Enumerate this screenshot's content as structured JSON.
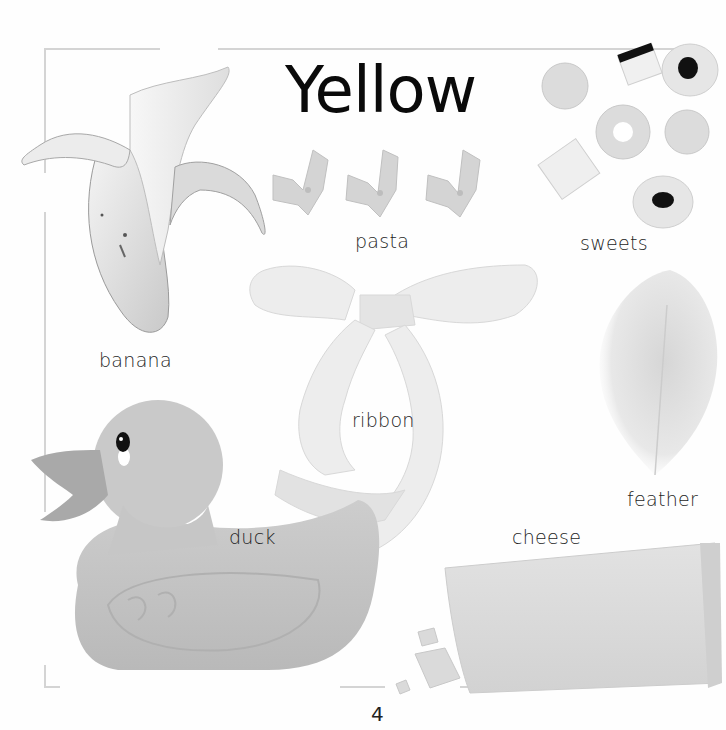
{
  "page": {
    "title": "Yellow",
    "page_number": "4",
    "colors": {
      "background": "#ffffff",
      "frame": "#d4d4d4",
      "text": "#1a1a1a"
    }
  },
  "items": [
    {
      "id": "banana",
      "label": "banana",
      "icon": "banana-icon"
    },
    {
      "id": "pasta",
      "label": "pasta",
      "icon": "pasta-icon"
    },
    {
      "id": "sweets",
      "label": "sweets",
      "icon": "sweets-icon"
    },
    {
      "id": "ribbon",
      "label": "ribbon",
      "icon": "ribbon-icon"
    },
    {
      "id": "feather",
      "label": "feather",
      "icon": "feather-icon"
    },
    {
      "id": "duck",
      "label": "duck",
      "icon": "rubber-duck-icon"
    },
    {
      "id": "cheese",
      "label": "cheese",
      "icon": "cheese-icon"
    }
  ]
}
